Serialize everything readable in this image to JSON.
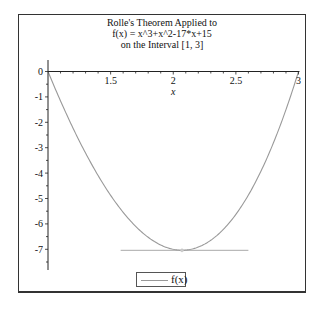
{
  "chart_data": {
    "type": "line",
    "title": [
      "Rolle's Theorem Applied to",
      "f(x) = x^3+x^2-17*x+15",
      "on the Interval [1, 3]"
    ],
    "xlabel": "x",
    "ylabel": "",
    "function": "x^3+x^2-17*x+15",
    "xlim": [
      1,
      3
    ],
    "ylim": [
      -7.8,
      0.4
    ],
    "x_ticks": [
      1.5,
      2,
      2.5,
      3
    ],
    "x_tick_labels": [
      "1.5",
      "2",
      "2.5",
      "3"
    ],
    "y_ticks": [
      0,
      -1,
      -2,
      -3,
      -4,
      -5,
      -6,
      -7
    ],
    "y_tick_labels": [
      "0",
      "-1",
      "-2",
      "-3",
      "-4",
      "-5",
      "-6",
      "-7"
    ],
    "series": [
      {
        "name": "f(x)",
        "color": "#999999",
        "x": [
          1.0,
          1.1,
          1.2,
          1.3,
          1.4,
          1.5,
          1.6,
          1.7,
          1.8,
          1.9,
          2.0,
          2.07,
          2.1,
          2.2,
          2.3,
          2.4,
          2.5,
          2.6,
          2.7,
          2.8,
          2.9,
          3.0
        ],
        "y": [
          0,
          -1.359,
          -2.632,
          -3.813,
          -4.896,
          -5.875,
          -6.744,
          -7.497,
          -8.128,
          -8.631,
          -9.0,
          -7.04,
          -7.04,
          -6.552,
          -5.943,
          -5.136,
          -4.125,
          -2.904,
          -1.467,
          0.192,
          2.079,
          0
        ]
      }
    ],
    "tangent_line": {
      "y": -7.04,
      "x_start": 1.58,
      "x_end": 2.6,
      "color": "#aaaaaa"
    },
    "critical_point": {
      "x": 2.07,
      "y": -7.04
    },
    "legend": {
      "position": "bottom",
      "entries": [
        "f(x)"
      ]
    },
    "grid": false
  },
  "legend": {
    "label": "f(x)"
  }
}
